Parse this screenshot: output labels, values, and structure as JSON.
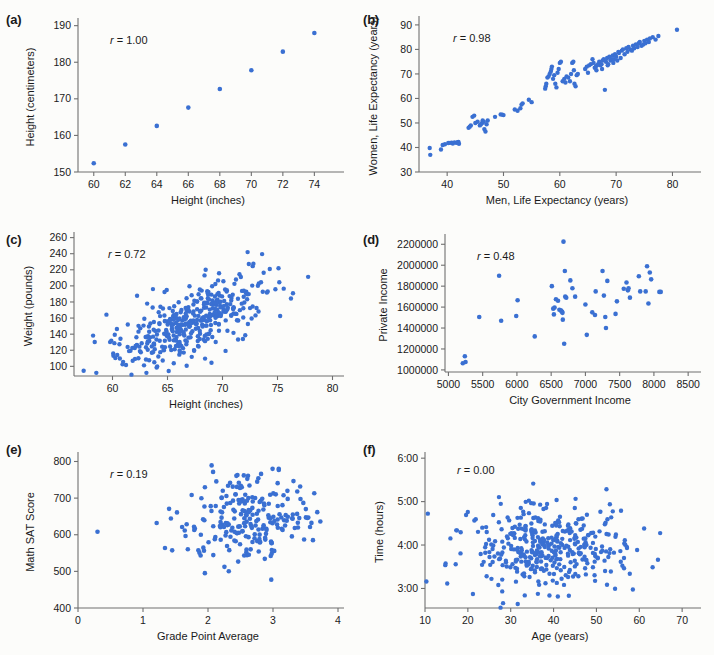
{
  "figure": {
    "background": "#fcfcfa",
    "point_color": "#3a70d2",
    "axis_color": "#6f6f6f",
    "panels": [
      "a",
      "b",
      "c",
      "d",
      "e",
      "f"
    ]
  },
  "chart_data": [
    {
      "id": "a",
      "panel_label": "(a)",
      "type": "scatter",
      "title": "",
      "annotation": "r = 1.00",
      "r_symbol": "r",
      "r_value": "= 1.00",
      "xlabel": "Height (inches)",
      "ylabel": "Height (centimeters)",
      "xlim": [
        59,
        75.5
      ],
      "ylim": [
        150,
        191
      ],
      "xticks": [
        60,
        62,
        64,
        66,
        68,
        70,
        72,
        74
      ],
      "yticks": [
        150,
        160,
        170,
        180,
        190
      ],
      "grid": false,
      "legend": "none",
      "x": [
        60,
        62,
        64,
        66,
        68,
        70,
        72,
        74
      ],
      "y": [
        152.4,
        157.5,
        162.6,
        167.6,
        172.7,
        177.8,
        182.9,
        188.0
      ]
    },
    {
      "id": "b",
      "panel_label": "(b)",
      "type": "scatter",
      "title": "",
      "annotation": "r = 0.98",
      "r_symbol": "r",
      "r_value": "= 0.98",
      "xlabel": "Men, Life Expectancy (years)",
      "ylabel": "Women, Life Expectancy (years)",
      "xlim": [
        35,
        84
      ],
      "ylim": [
        30,
        92
      ],
      "xticks": [
        40,
        50,
        60,
        70,
        80
      ],
      "yticks": [
        30,
        40,
        50,
        60,
        70,
        80,
        90
      ],
      "grid": false,
      "legend": "none",
      "x": [
        36.9,
        37.0,
        38.9,
        39.2,
        39.6,
        40.2,
        40.5,
        40.8,
        41.0,
        41.3,
        41.6,
        41.8,
        41.9,
        42.0,
        42.1,
        43.8,
        44.0,
        44.2,
        44.5,
        44.8,
        45.0,
        45.4,
        45.8,
        46.0,
        46.2,
        46.3,
        46.5,
        46.6,
        46.8,
        47.0,
        47.2,
        48.5,
        49.5,
        49.8,
        50.0,
        52.0,
        52.5,
        53.0,
        53.2,
        53.4,
        54.5,
        55.0,
        57.4,
        57.5,
        57.6,
        57.8,
        58.0,
        58.2,
        58.4,
        58.5,
        58.6,
        58.8,
        59.0,
        59.2,
        59.4,
        59.6,
        59.8,
        60.0,
        60.2,
        60.5,
        60.8,
        61.0,
        61.2,
        61.5,
        61.8,
        62.0,
        62.2,
        62.4,
        62.5,
        62.6,
        62.8,
        63.0,
        63.2,
        64.5,
        64.8,
        65.0,
        65.2,
        65.5,
        65.8,
        66.0,
        66.2,
        66.4,
        66.5,
        66.6,
        66.8,
        67.0,
        67.2,
        67.4,
        67.5,
        67.6,
        67.8,
        68.0,
        68.2,
        68.4,
        68.5,
        68.6,
        68.8,
        69.0,
        69.2,
        69.4,
        69.5,
        69.6,
        69.8,
        70.0,
        70.2,
        70.4,
        70.5,
        70.8,
        71.0,
        71.2,
        71.5,
        71.8,
        72.0,
        72.2,
        72.5,
        72.8,
        73.0,
        73.2,
        73.5,
        73.8,
        74.0,
        74.2,
        74.5,
        74.8,
        75.0,
        75.2,
        75.5,
        75.8,
        76.0,
        76.5,
        77.0,
        77.5,
        80.8
      ],
      "y": [
        39.8,
        37.0,
        39.2,
        41.0,
        41.3,
        41.8,
        41.9,
        42.0,
        41.6,
        42.1,
        41.9,
        42.0,
        42.2,
        42.3,
        41.5,
        48.0,
        48.5,
        49.0,
        52.5,
        53.0,
        50.0,
        50.5,
        49.0,
        49.5,
        50.0,
        51.0,
        50.5,
        47.5,
        46.5,
        49.5,
        51.0,
        52.5,
        53.5,
        53.4,
        53.2,
        55.5,
        55.0,
        56.0,
        57.5,
        58.0,
        59.5,
        58.5,
        64.0,
        65.0,
        66.0,
        68.5,
        69.0,
        70.0,
        71.0,
        72.0,
        73.0,
        68.0,
        69.5,
        66.0,
        64.5,
        70.5,
        72.0,
        74.5,
        75.0,
        67.0,
        68.0,
        66.5,
        69.0,
        68.5,
        67.0,
        70.0,
        74.5,
        75.0,
        71.5,
        66.0,
        65.0,
        69.5,
        70.0,
        72.0,
        73.0,
        70.5,
        73.5,
        74.0,
        76.0,
        74.5,
        72.5,
        73.0,
        71.5,
        73.5,
        74.0,
        75.0,
        73.5,
        74.0,
        72.0,
        75.5,
        76.0,
        63.5,
        75.0,
        76.5,
        73.5,
        74.0,
        77.0,
        75.5,
        76.0,
        77.5,
        74.5,
        76.0,
        78.0,
        77.0,
        75.5,
        79.0,
        78.5,
        76.5,
        79.5,
        80.0,
        78.0,
        80.5,
        79.0,
        81.0,
        80.0,
        79.5,
        81.5,
        80.5,
        82.0,
        81.0,
        82.5,
        83.0,
        81.5,
        82.0,
        83.5,
        82.5,
        84.0,
        83.0,
        84.5,
        85.0,
        84.0,
        85.5,
        88.0
      ]
    },
    {
      "id": "c",
      "panel_label": "(c)",
      "type": "scatter",
      "title": "",
      "annotation": "r = 0.72",
      "r_symbol": "r",
      "r_value": "= 0.72",
      "xlabel": "Height (inches)",
      "ylabel": "Weight (pounds)",
      "xlim": [
        56.5,
        80.5
      ],
      "ylim": [
        88,
        262
      ],
      "xticks": [
        60,
        65,
        70,
        75,
        80
      ],
      "yticks": [
        100,
        120,
        140,
        160,
        180,
        200,
        220,
        240,
        260
      ],
      "grid": false,
      "legend": "none",
      "n_points": 420,
      "x_mean": 67.0,
      "y_mean": 155.0,
      "r": 0.72,
      "x_sd": 3.6,
      "y_sd": 30.0,
      "generated": true
    },
    {
      "id": "d",
      "panel_label": "(d)",
      "type": "scatter",
      "title": "",
      "annotation": "r = 0.48",
      "r_symbol": "r",
      "r_value": "= 0.48",
      "xlabel": "City Government Income",
      "ylabel": "Private Income",
      "xlim": [
        4950,
        8600
      ],
      "ylim": [
        980000,
        2260000
      ],
      "xticks": [
        5000,
        5500,
        6000,
        6500,
        7000,
        7500,
        8000,
        8500
      ],
      "yticks": [
        1000000,
        1200000,
        1400000,
        1600000,
        1800000,
        2000000,
        2200000
      ],
      "grid": false,
      "legend": "none",
      "x": [
        5210,
        5240,
        5250,
        5450,
        5740,
        5770,
        5990,
        6010,
        6260,
        6510,
        6530,
        6540,
        6550,
        6570,
        6600,
        6620,
        6640,
        6650,
        6660,
        6665,
        6670,
        6680,
        6690,
        6700,
        6705,
        6720,
        6780,
        6810,
        6850,
        7000,
        7020,
        7100,
        7140,
        7150,
        7250,
        7270,
        7290,
        7300,
        7320,
        7440,
        7460,
        7560,
        7600,
        7620,
        7630,
        7650,
        7780,
        7800,
        7880,
        7900,
        7920,
        7940,
        7960,
        8080,
        8100
      ],
      "y": [
        1063000,
        1130000,
        1075000,
        1505000,
        1900000,
        1470000,
        1515000,
        1665000,
        1320000,
        1800000,
        1585000,
        1530000,
        1595000,
        1675000,
        1660000,
        1575000,
        1570000,
        1560000,
        1555000,
        1545000,
        1480000,
        2225000,
        1250000,
        1945000,
        1700000,
        1690000,
        1855000,
        1780000,
        1700000,
        1625000,
        1335000,
        1550000,
        1525000,
        1750000,
        1945000,
        1710000,
        1505000,
        1400000,
        1850000,
        1535000,
        1655000,
        1775000,
        1835000,
        1760000,
        1780000,
        1690000,
        1895000,
        1750000,
        1750000,
        1990000,
        1635000,
        1930000,
        1865000,
        1745000,
        1745000
      ]
    },
    {
      "id": "e",
      "panel_label": "(e)",
      "type": "scatter",
      "title": "",
      "annotation": "r = 0.19",
      "r_symbol": "r",
      "r_value": "= 0.19",
      "xlabel": "Grade Point Average",
      "ylabel": "Math SAT Score",
      "xlim": [
        0,
        4
      ],
      "ylim": [
        400,
        815
      ],
      "xticks": [
        0,
        1,
        2,
        3,
        4
      ],
      "yticks": [
        400,
        500,
        600,
        700,
        800
      ],
      "grid": false,
      "legend": "none",
      "n_points": 240,
      "x_mean": 2.65,
      "y_mean": 650,
      "r": 0.19,
      "x_sd": 0.5,
      "y_sd": 62,
      "outlier": [
        0.3,
        608
      ],
      "generated": true
    },
    {
      "id": "f",
      "panel_label": "(f)",
      "type": "scatter",
      "title": "",
      "annotation": "r = 0.00",
      "r_symbol": "r",
      "r_value": "= 0.00",
      "xlabel": "Age (years)",
      "ylabel": "Time (hours)",
      "xlim": [
        10,
        73
      ],
      "ylim": [
        2.55,
        6.05
      ],
      "xticks": [
        10,
        20,
        30,
        40,
        50,
        60,
        70
      ],
      "yticks": [
        3,
        4,
        5,
        6
      ],
      "ytick_labels": [
        "3:00",
        "4:00",
        "5:00",
        "6:00"
      ],
      "grid": false,
      "legend": "none",
      "n_points": 400,
      "x_mean": 38.5,
      "y_mean": 3.95,
      "r": 0.0,
      "x_sd": 9.5,
      "y_sd": 0.52,
      "generated": true
    }
  ]
}
